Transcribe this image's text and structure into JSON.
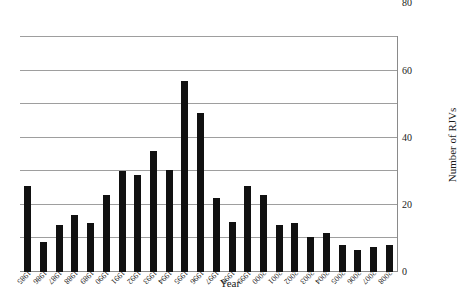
{
  "chart_data": {
    "type": "bar",
    "title": "",
    "xlabel": "Year",
    "ylabel": "Number of RJVs",
    "orientation": "inverted-180",
    "grid": true,
    "legend": "none",
    "ylim": [
      0,
      140
    ],
    "yticks": [
      0,
      20,
      40,
      60,
      80,
      100,
      120,
      140
    ],
    "ytick_labels": [
      "0",
      "20",
      "40",
      "60",
      "80",
      "100",
      "120",
      "140"
    ],
    "categories": [
      "2008",
      "2007",
      "2006",
      "2005",
      "2004",
      "2003",
      "2002",
      "2001",
      "2000",
      "1999",
      "1998",
      "1997",
      "1996",
      "1995",
      "1994",
      "1993",
      "1992",
      "1991",
      "1990",
      "1989",
      "1988",
      "1987",
      "1986",
      "1985"
    ],
    "values": [
      16,
      15,
      13,
      16,
      23,
      21,
      29,
      28,
      46,
      51,
      30,
      44,
      95,
      114,
      61,
      72,
      58,
      60,
      46,
      29,
      34,
      28,
      18,
      51
    ],
    "series": [
      {
        "name": "Number of RJVs",
        "values": [
          16,
          15,
          13,
          16,
          23,
          21,
          29,
          28,
          46,
          51,
          30,
          44,
          95,
          114,
          61,
          72,
          58,
          60,
          46,
          29,
          34,
          28,
          18,
          51
        ]
      }
    ],
    "bar_color": "#111111",
    "gridline_color": "#9e9e9e",
    "axis_color": "#8a8a8a"
  }
}
